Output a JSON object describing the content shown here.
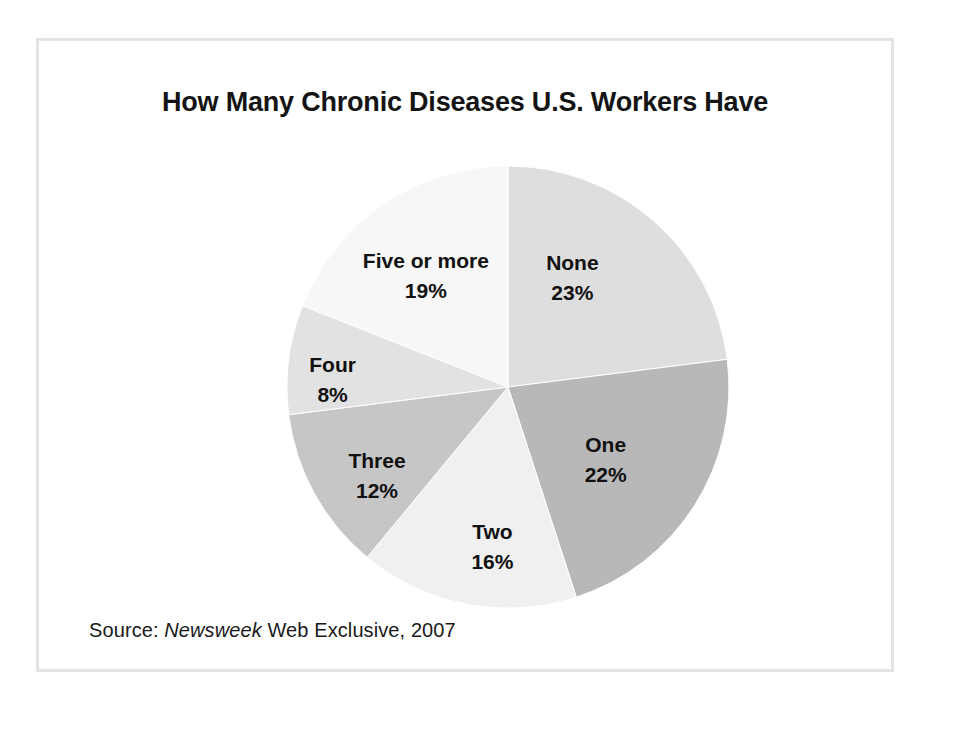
{
  "chart_data": {
    "type": "pie",
    "title": "How Many Chronic Diseases U.S. Workers Have",
    "xlabel": "",
    "ylabel": "",
    "legend_position": "none",
    "grid": false,
    "labels_inside_slices": true,
    "start_angle_deg": 0,
    "direction": "clockwise",
    "categories": [
      "None",
      "One",
      "Two",
      "Three",
      "Four",
      "Five or more"
    ],
    "values": [
      23,
      22,
      16,
      12,
      8,
      19
    ],
    "value_suffix": "%",
    "total": 100,
    "slices": [
      {
        "label": "None",
        "value": 23,
        "value_text": "23%",
        "color": "#dedede"
      },
      {
        "label": "One",
        "value": 22,
        "value_text": "22%",
        "color": "#b8b8b8"
      },
      {
        "label": "Two",
        "value": 16,
        "value_text": "16%",
        "color": "#f0f0f0"
      },
      {
        "label": "Three",
        "value": 12,
        "value_text": "12%",
        "color": "#c6c6c6"
      },
      {
        "label": "Four",
        "value": 8,
        "value_text": "8%",
        "color": "#e2e2e2"
      },
      {
        "label": "Five or more",
        "value": 19,
        "value_text": "19%",
        "color": "#f7f7f7"
      }
    ]
  },
  "source": {
    "prefix": "Source:",
    "publication": "Newsweek",
    "suffix": "Web Exclusive, 2007"
  },
  "colors": {
    "frame_border": "#e3e3e3",
    "background": "#ffffff",
    "text": "#111111",
    "slice_outline": "#ffffff"
  }
}
